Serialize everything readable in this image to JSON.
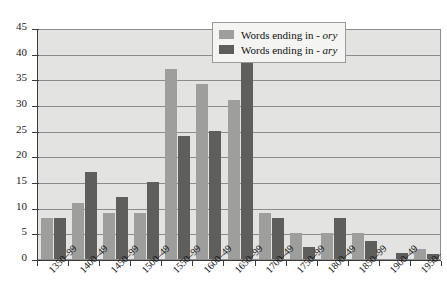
{
  "chart_data": {
    "type": "bar",
    "title": "",
    "xlabel": "",
    "ylabel": "",
    "ylim": [
      0,
      45
    ],
    "ytick_step": 5,
    "yticks": [
      "0",
      "5",
      "10",
      "15",
      "20",
      "25",
      "30",
      "35",
      "40",
      "45"
    ],
    "grid": true,
    "legend_position": "top-right",
    "categories": [
      "1350–99",
      "1400–49",
      "1450–99",
      "1500–49",
      "1550–99",
      "1600–49",
      "1650–99",
      "1700–49",
      "1750–99",
      "1800–49",
      "1850–99",
      "1900–49",
      "1950–"
    ],
    "series": [
      {
        "name": "Words ending in - ory",
        "label_prefix": "Words ending in - ",
        "label_suffix": "ory",
        "color": "#9e9e9c",
        "values": [
          8,
          11,
          9,
          9,
          37,
          34,
          31,
          9,
          5,
          5,
          5,
          0,
          2
        ]
      },
      {
        "name": "Words ending in - ary",
        "label_prefix": "Words ending in - ",
        "label_suffix": "ary",
        "color": "#5e5e5c",
        "values": [
          8,
          17,
          12,
          15,
          24,
          25,
          41,
          8,
          2.3,
          8,
          3.5,
          1.2,
          1
        ]
      }
    ]
  },
  "colors": {
    "plot_background": "#e3e3e1",
    "gridline": "#8c8c8c",
    "axis": "#3b3b3b",
    "legend_background": "#f4f4f2",
    "page_background": "#ffffff"
  }
}
